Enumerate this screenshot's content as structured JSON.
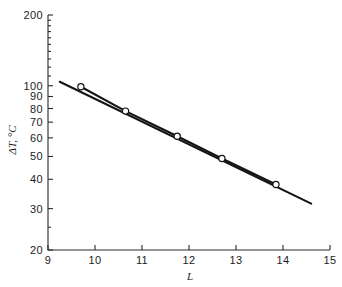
{
  "figure": {
    "background": "#ffffff",
    "ink_color": "#141414"
  },
  "axes": {
    "x_label": "L",
    "y_label": "ΔT, °C",
    "x_ticks": [
      "9",
      "10",
      "11",
      "12",
      "13",
      "14",
      "15"
    ],
    "y_ticks": [
      "20",
      "30",
      "40",
      "50",
      "60",
      "70",
      "80",
      "90",
      "100",
      "200"
    ]
  },
  "chart_data": {
    "type": "line",
    "title": "",
    "subtitle": "",
    "xlabel": "L",
    "ylabel": "ΔT, °C",
    "xscale": "linear",
    "yscale": "log",
    "xlim": [
      9,
      15
    ],
    "ylim": [
      20,
      200
    ],
    "xticks": [
      9,
      10,
      11,
      12,
      13,
      14,
      15
    ],
    "yticks": [
      20,
      30,
      40,
      50,
      60,
      70,
      80,
      90,
      100,
      200
    ],
    "grid": false,
    "legend": null,
    "annotations": [],
    "series": [
      {
        "name": "ΔT vs L",
        "marker": "open-circle",
        "line": "solid",
        "x": [
          9.7,
          10.65,
          11.75,
          12.7,
          13.85
        ],
        "y": [
          99,
          78,
          61,
          49,
          38
        ]
      },
      {
        "name": "fit line",
        "marker": "none",
        "line": "solid",
        "x": [
          9.25,
          14.6
        ],
        "y": [
          104,
          31.5
        ]
      }
    ]
  }
}
